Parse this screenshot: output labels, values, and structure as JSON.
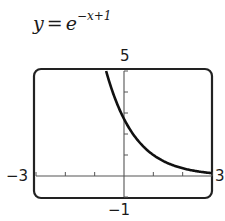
{
  "title": {
    "lhs": "y",
    "equals": "=",
    "base": "e",
    "exponent": "−x+1"
  },
  "window": {
    "ymax_label": "5",
    "ymin_label": "−1",
    "xmin_label": "−3",
    "xmax_label": "3"
  },
  "chart_data": {
    "type": "line",
    "xlabel": "",
    "ylabel": "",
    "xlim": [
      -3,
      3
    ],
    "ylim": [
      -1,
      5
    ],
    "xticks": [
      -3,
      -2,
      -1,
      0,
      1,
      2,
      3
    ],
    "yticks": [
      -1,
      0,
      1,
      2,
      3,
      4,
      5
    ],
    "grid": false,
    "series": [
      {
        "name": "y = e^(−x+1)",
        "x": [
          -0.609,
          -0.5,
          -0.25,
          0,
          0.25,
          0.5,
          0.75,
          1,
          1.5,
          2,
          2.5,
          3
        ],
        "y": [
          5.0,
          4.48,
          3.49,
          2.72,
          2.12,
          1.65,
          1.28,
          1.0,
          0.61,
          0.37,
          0.22,
          0.14
        ]
      }
    ],
    "colors": {
      "curve": "#111111",
      "axes": "#555555",
      "frame": "#222222"
    }
  }
}
